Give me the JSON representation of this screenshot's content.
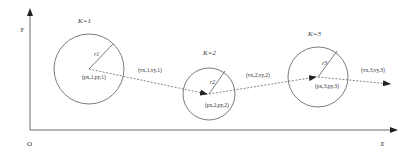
{
  "diagram": {
    "type": "trajectory-with-circles",
    "axes": {
      "origin_label": "O",
      "x_label": "X",
      "y_label": "Y"
    },
    "steps": [
      {
        "k_label": "K=1",
        "radius_label": "r1",
        "center_label": "(px,1,py,1)",
        "velocity_label": "(vx,1,vy,1)"
      },
      {
        "k_label": "K=2",
        "radius_label": "r2",
        "center_label": "(px,2,py,2)",
        "velocity_label": "(vx,2,vy,2)"
      },
      {
        "k_label": "K=3",
        "radius_label": "r3",
        "center_label": "(px,3,py,3)",
        "velocity_label": "(vx,3,vy,3)"
      }
    ],
    "colors": {
      "line": "#333333",
      "dashed": "#555555",
      "background": "#ffffff"
    }
  }
}
